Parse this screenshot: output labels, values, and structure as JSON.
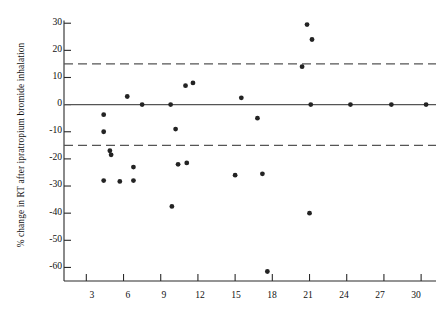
{
  "chart_data": {
    "type": "scatter",
    "title": "",
    "xlabel": "Age (month)",
    "ylabel": "% change in RT after ipratropium bromide inhalation",
    "xlim": [
      1.2,
      31.2
    ],
    "ylim": [
      -65,
      31
    ],
    "xticks": [
      3,
      6,
      9,
      12,
      15,
      18,
      21,
      24,
      27,
      30
    ],
    "yticks": [
      30,
      20,
      10,
      0,
      -10,
      -20,
      -30,
      -40,
      -50,
      -60
    ],
    "grid": false,
    "legend": "none",
    "marker": "filled-circle",
    "marker_color": "#232323",
    "reference_lines": [
      {
        "name": "upper-limit-line",
        "y": 15,
        "style": "dashed",
        "color": "#555555"
      },
      {
        "name": "zero-line",
        "y": 0,
        "style": "solid",
        "color": "#555555"
      },
      {
        "name": "lower-limit-line",
        "y": -15,
        "style": "dashed",
        "color": "#555555"
      }
    ],
    "points": [
      {
        "x": 4.4,
        "y": -3.7
      },
      {
        "x": 4.4,
        "y": -10.0
      },
      {
        "x": 4.9,
        "y": -17.0
      },
      {
        "x": 5.0,
        "y": -18.5
      },
      {
        "x": 4.4,
        "y": -28.0
      },
      {
        "x": 5.7,
        "y": -28.3
      },
      {
        "x": 6.8,
        "y": -28.0
      },
      {
        "x": 6.8,
        "y": -23.0
      },
      {
        "x": 6.3,
        "y": 3.0
      },
      {
        "x": 7.5,
        "y": 0.0
      },
      {
        "x": 9.8,
        "y": 0.0
      },
      {
        "x": 10.2,
        "y": -9.0
      },
      {
        "x": 10.4,
        "y": -22.0
      },
      {
        "x": 9.9,
        "y": -37.5
      },
      {
        "x": 11.0,
        "y": 7.0
      },
      {
        "x": 11.6,
        "y": 8.0
      },
      {
        "x": 11.1,
        "y": -21.5
      },
      {
        "x": 15.5,
        "y": 2.5
      },
      {
        "x": 16.8,
        "y": -5.0
      },
      {
        "x": 15.0,
        "y": -26.0
      },
      {
        "x": 17.2,
        "y": -25.5
      },
      {
        "x": 17.6,
        "y": -61.5
      },
      {
        "x": 20.4,
        "y": 14.0
      },
      {
        "x": 20.8,
        "y": 29.5
      },
      {
        "x": 21.2,
        "y": 24.0
      },
      {
        "x": 21.1,
        "y": 0.0
      },
      {
        "x": 21.0,
        "y": -40.0
      },
      {
        "x": 24.3,
        "y": 0.0
      },
      {
        "x": 27.6,
        "y": 0.0
      },
      {
        "x": 30.4,
        "y": 0.0
      }
    ]
  }
}
